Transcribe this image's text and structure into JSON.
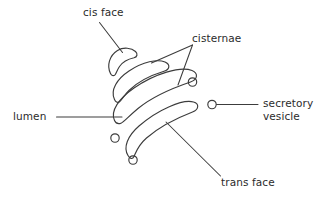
{
  "diagram": {
    "background_color": "#ffffff",
    "stroke_color": "#3c3c3c",
    "labels": {
      "cis_face": "cis face",
      "cisternae": "cisternae",
      "lumen": "lumen",
      "secretory_vesicle_line1": "secretory",
      "secretory_vesicle_line2": "vesicle",
      "trans_face": "trans face"
    },
    "structures": {
      "cisternae_count": 4,
      "vesicle_count": 4
    }
  }
}
